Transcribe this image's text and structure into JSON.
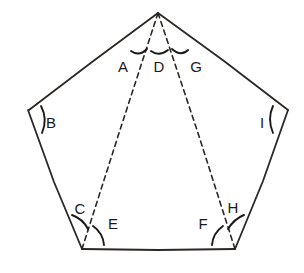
{
  "diagram": {
    "shape_name": "pentagon",
    "background_color": "#ffffff",
    "stroke_color": "#2b2724",
    "dashed_stroke_color": "#2b2724",
    "label_color": "#1a1a1a",
    "arc_color": "#1a1a1a",
    "canvas": {
      "width": 304,
      "height": 273
    },
    "vertices": [
      {
        "name": "apex-top",
        "x": 158,
        "y": 13
      },
      {
        "name": "left-upper",
        "x": 28,
        "y": 110
      },
      {
        "name": "left-lower",
        "x": 82,
        "y": 249
      },
      {
        "name": "right-lower",
        "x": 235,
        "y": 249
      },
      {
        "name": "right-upper",
        "x": 288,
        "y": 110
      }
    ],
    "edges": [
      {
        "name": "edge-apex-to-left-upper",
        "from": "apex-top",
        "to": "left-upper",
        "style": "solid"
      },
      {
        "name": "edge-left-upper-to-left-lower",
        "from": "left-upper",
        "to": "left-lower",
        "style": "solid"
      },
      {
        "name": "edge-bottom",
        "from": "left-lower",
        "to": "right-lower",
        "style": "solid"
      },
      {
        "name": "edge-right-lower-to-right-upper",
        "from": "right-lower",
        "to": "right-upper",
        "style": "solid"
      },
      {
        "name": "edge-right-upper-to-apex",
        "from": "right-upper",
        "to": "apex-top",
        "style": "solid"
      }
    ],
    "diagonals": [
      {
        "name": "diagonal-apex-to-left-lower",
        "from": "apex-top",
        "to": "left-lower",
        "style": "dashed"
      },
      {
        "name": "diagonal-apex-to-right-lower",
        "from": "apex-top",
        "to": "right-lower",
        "style": "dashed"
      }
    ],
    "angles": [
      {
        "id": "A",
        "label": "A",
        "label_x": 123,
        "label_y": 66,
        "vertex": "apex-top"
      },
      {
        "id": "B",
        "label": "B",
        "label_x": 51,
        "label_y": 122,
        "vertex": "left-upper"
      },
      {
        "id": "C",
        "label": "C",
        "label_x": 80,
        "label_y": 208,
        "vertex": "left-lower"
      },
      {
        "id": "D",
        "label": "D",
        "label_x": 159,
        "label_y": 66,
        "vertex": "apex-top"
      },
      {
        "id": "E",
        "label": "E",
        "label_x": 113,
        "label_y": 223,
        "vertex": "left-lower"
      },
      {
        "id": "F",
        "label": "F",
        "label_x": 203,
        "label_y": 223,
        "vertex": "right-lower"
      },
      {
        "id": "G",
        "label": "G",
        "label_x": 196,
        "label_y": 66,
        "vertex": "apex-top"
      },
      {
        "id": "H",
        "label": "H",
        "label_x": 233,
        "label_y": 207,
        "vertex": "right-lower"
      },
      {
        "id": "I",
        "label": "I",
        "label_x": 262,
        "label_y": 122,
        "vertex": "right-upper"
      }
    ]
  }
}
